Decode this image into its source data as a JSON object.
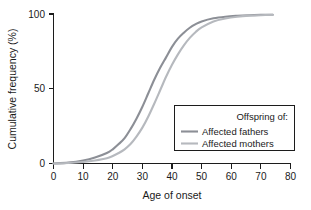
{
  "chart_data": {
    "type": "line",
    "title": "",
    "xlabel": "Age of onset",
    "ylabel": "Cumulative frequency (%)",
    "xlim": [
      0,
      80
    ],
    "ylim": [
      0,
      100
    ],
    "xticks": [
      0,
      10,
      20,
      30,
      40,
      50,
      60,
      70,
      80
    ],
    "xticklabels": [
      "0",
      "10",
      "20",
      "30",
      "40",
      "50",
      "60",
      "70",
      "80"
    ],
    "yticks": [
      0,
      50,
      100
    ],
    "yticklabels": [
      "0",
      "50",
      "100"
    ],
    "grid": false,
    "legend_position": "lower right",
    "legend_title": "Offspring of:",
    "series": [
      {
        "name": "Affected fathers",
        "color": "#8c8f96",
        "x": [
          0,
          5,
          10,
          14,
          18,
          20,
          22,
          24,
          26,
          28,
          30,
          32,
          34,
          36,
          38,
          40,
          42,
          44,
          46,
          48,
          50,
          54,
          58,
          62,
          66,
          70,
          74
        ],
        "values": [
          0,
          0.6,
          2,
          4,
          7,
          9.5,
          13,
          17,
          23,
          30,
          38,
          47,
          56,
          64,
          71,
          78,
          83.5,
          87.5,
          90.8,
          93.2,
          95,
          97.1,
          98.2,
          98.8,
          99.2,
          99.4,
          99.5
        ]
      },
      {
        "name": "Affected mothers",
        "color": "#b6b9be",
        "x": [
          0,
          5,
          10,
          14,
          18,
          20,
          22,
          24,
          26,
          28,
          30,
          32,
          34,
          36,
          38,
          40,
          42,
          44,
          46,
          48,
          50,
          54,
          58,
          62,
          66,
          70,
          74
        ],
        "values": [
          0,
          0.3,
          1,
          2,
          3.5,
          5,
          7,
          9.5,
          13,
          18,
          24,
          31.5,
          40,
          49,
          58,
          66,
          73,
          79,
          84,
          88,
          91,
          95,
          97,
          98.2,
          98.9,
          99.2,
          99.4
        ]
      }
    ]
  },
  "legend": {
    "title": "Offspring of:",
    "entries": [
      {
        "label": "Affected fathers",
        "color": "#8c8f96"
      },
      {
        "label": "Affected mothers",
        "color": "#b6b9be"
      }
    ]
  },
  "axes": {
    "x_title": "Age of onset",
    "y_title": "Cumulative frequency (%)",
    "x_tick_labels": [
      "0",
      "10",
      "20",
      "30",
      "40",
      "50",
      "60",
      "70",
      "80"
    ],
    "y_tick_labels": [
      "0",
      "50",
      "100"
    ]
  },
  "colors": {
    "axis": "#1c1c1c",
    "text": "#1a1a1a",
    "background": "#ffffff",
    "series_fathers": "#8c8f96",
    "series_mothers": "#b6b9be"
  }
}
